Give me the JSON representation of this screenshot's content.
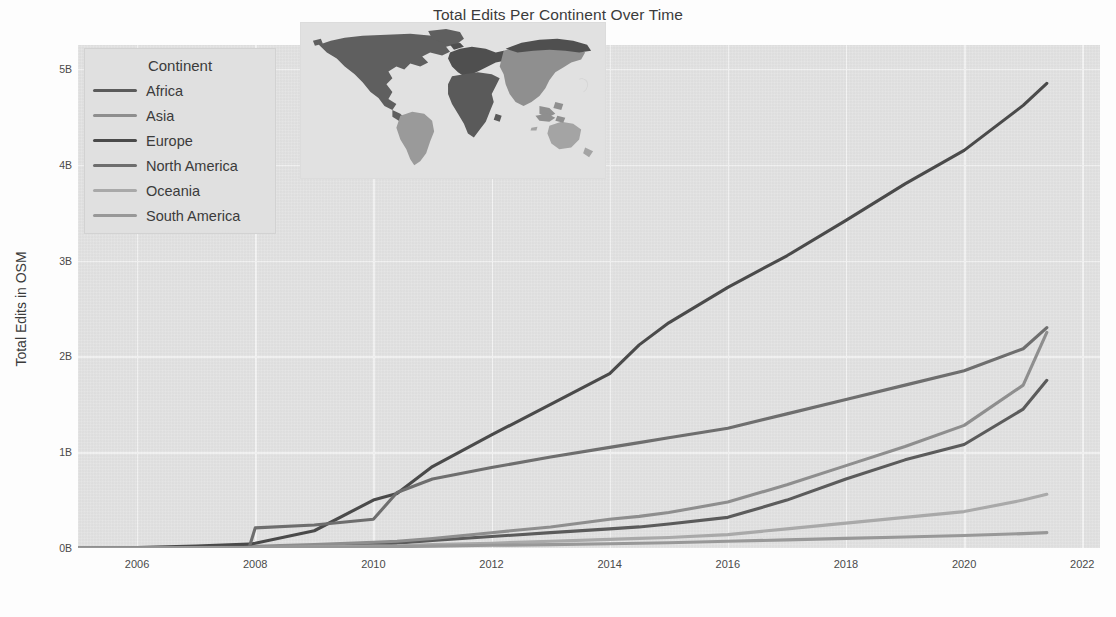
{
  "chart_data": {
    "type": "line",
    "title": "Total Edits Per Continent Over Time",
    "xlabel": "",
    "ylabel": "Total Edits in OSM",
    "xlim": [
      2005.0,
      2022.3
    ],
    "ylim": [
      0,
      5.25
    ],
    "xticks": [
      2006,
      2008,
      2010,
      2012,
      2014,
      2016,
      2018,
      2020,
      2022
    ],
    "xtick_labels": [
      "2006",
      "2008",
      "2010",
      "2012",
      "2014",
      "2016",
      "2018",
      "2020",
      "2022"
    ],
    "yticks": [
      0,
      1,
      2,
      3,
      4,
      5
    ],
    "ytick_labels": [
      "0B",
      "1B",
      "2B",
      "3B",
      "4B",
      "5B"
    ],
    "y_unit": "billions of edits",
    "grid": true,
    "legend_position": "upper-left",
    "legend_title": "Continent",
    "x": [
      2005.0,
      2006.0,
      2007.0,
      2007.9,
      2008.0,
      2009.0,
      2010.0,
      2010.4,
      2011.0,
      2012.0,
      2013.0,
      2014.0,
      2014.5,
      2015.0,
      2016.0,
      2017.0,
      2018.0,
      2019.0,
      2020.0,
      2021.0,
      2021.4
    ],
    "series": [
      {
        "name": "Africa",
        "color": "#5b5b5b",
        "values": [
          0.0,
          0.0,
          0.005,
          0.01,
          0.012,
          0.02,
          0.04,
          0.05,
          0.08,
          0.12,
          0.16,
          0.2,
          0.22,
          0.25,
          0.32,
          0.5,
          0.72,
          0.92,
          1.08,
          1.45,
          1.75
        ]
      },
      {
        "name": "Asia",
        "color": "#8e8e8e",
        "values": [
          0.0,
          0.0,
          0.008,
          0.015,
          0.018,
          0.035,
          0.06,
          0.07,
          0.1,
          0.16,
          0.22,
          0.3,
          0.33,
          0.37,
          0.48,
          0.66,
          0.86,
          1.06,
          1.28,
          1.7,
          2.25
        ]
      },
      {
        "name": "Europe",
        "color": "#4a4a4a",
        "values": [
          0.0,
          0.005,
          0.02,
          0.04,
          0.05,
          0.18,
          0.5,
          0.57,
          0.85,
          1.18,
          1.5,
          1.82,
          2.12,
          2.35,
          2.72,
          3.05,
          3.42,
          3.8,
          4.15,
          4.62,
          4.85
        ]
      },
      {
        "name": "North America",
        "color": "#6e6e6e",
        "values": [
          0.0,
          0.0,
          0.005,
          0.01,
          0.21,
          0.24,
          0.3,
          0.58,
          0.72,
          0.84,
          0.95,
          1.05,
          1.1,
          1.15,
          1.25,
          1.4,
          1.55,
          1.7,
          1.85,
          2.08,
          2.3
        ]
      },
      {
        "name": "Oceania",
        "color": "#a9a9a9",
        "values": [
          0.0,
          0.0,
          0.002,
          0.004,
          0.005,
          0.01,
          0.02,
          0.022,
          0.035,
          0.05,
          0.07,
          0.09,
          0.1,
          0.11,
          0.14,
          0.2,
          0.26,
          0.32,
          0.38,
          0.5,
          0.56
        ]
      },
      {
        "name": "South America",
        "color": "#989898",
        "values": [
          0.0,
          0.0,
          0.002,
          0.004,
          0.005,
          0.008,
          0.012,
          0.014,
          0.02,
          0.028,
          0.035,
          0.045,
          0.05,
          0.055,
          0.07,
          0.085,
          0.1,
          0.115,
          0.13,
          0.15,
          0.16
        ]
      }
    ]
  },
  "legend": {
    "title": "Continent",
    "items": [
      {
        "label": "Africa",
        "color": "#5b5b5b"
      },
      {
        "label": "Asia",
        "color": "#8e8e8e"
      },
      {
        "label": "Europe",
        "color": "#4a4a4a"
      },
      {
        "label": "North America",
        "color": "#6e6e6e"
      },
      {
        "label": "Oceania",
        "color": "#a9a9a9"
      },
      {
        "label": "South America",
        "color": "#989898"
      }
    ]
  },
  "inset_map": {
    "name": "world-continent-map",
    "regions": [
      {
        "name": "North America",
        "color": "#5f5f5f"
      },
      {
        "name": "South America",
        "color": "#9a9a9a"
      },
      {
        "name": "Europe",
        "color": "#4f4f4f"
      },
      {
        "name": "Africa",
        "color": "#5a5a5a"
      },
      {
        "name": "Asia",
        "color": "#8f8f8f"
      },
      {
        "name": "Oceania",
        "color": "#a4a4a4"
      }
    ]
  },
  "colors": {
    "plot_background": "#e3e3e3",
    "gridline": "#f4f4f4",
    "figure_background": "#fdfdfd",
    "text": "#3b3b3b"
  }
}
